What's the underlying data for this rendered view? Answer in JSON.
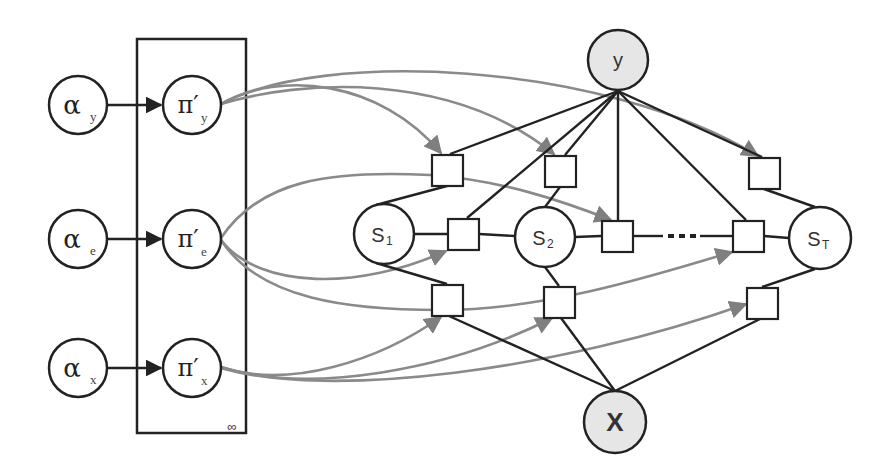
{
  "diagram": {
    "type": "graphical-model",
    "plate": {
      "label": "∞",
      "x": 137,
      "y": 39,
      "width": 109,
      "height": 394
    },
    "colors": {
      "edge": "#222222",
      "param_edge": "#8a8a8a",
      "observed_fill": "#e6e6e6",
      "latent_fill": "#ffffff"
    },
    "hyperparameters": [
      {
        "id": "alpha_y",
        "symbol": "α",
        "subscript": "y",
        "cx": 78,
        "cy": 105
      },
      {
        "id": "alpha_e",
        "symbol": "α",
        "subscript": "e",
        "cx": 78,
        "cy": 239
      },
      {
        "id": "alpha_x",
        "symbol": "α",
        "subscript": "x",
        "cx": 78,
        "cy": 368
      }
    ],
    "parameters": [
      {
        "id": "pi_y",
        "symbol": "π′",
        "subscript": "y",
        "cx": 192,
        "cy": 105
      },
      {
        "id": "pi_e",
        "symbol": "π′",
        "subscript": "e",
        "cx": 192,
        "cy": 239
      },
      {
        "id": "pi_x",
        "symbol": "π′",
        "subscript": "x",
        "cx": 192,
        "cy": 368
      }
    ],
    "observed": [
      {
        "id": "y",
        "label": "y",
        "cx": 618,
        "cy": 60
      },
      {
        "id": "x",
        "label": "X",
        "cx": 615,
        "cy": 422
      }
    ],
    "states": [
      {
        "id": "s1",
        "label": "S",
        "subscript": "1",
        "cx": 384,
        "cy": 234
      },
      {
        "id": "s2",
        "label": "S",
        "subscript": "2",
        "cx": 545,
        "cy": 237
      },
      {
        "id": "sT",
        "label": "S",
        "subscript": "T",
        "cx": 820,
        "cy": 238
      }
    ],
    "factors": [
      {
        "id": "f_top_1",
        "cx": 447,
        "cy": 170
      },
      {
        "id": "f_top_2",
        "cx": 560,
        "cy": 171
      },
      {
        "id": "f_top_T",
        "cx": 764,
        "cy": 173
      },
      {
        "id": "f_mid_1",
        "cx": 463,
        "cy": 234
      },
      {
        "id": "f_mid_2",
        "cx": 617,
        "cy": 236
      },
      {
        "id": "f_mid_T",
        "cx": 748,
        "cy": 236
      },
      {
        "id": "f_bot_1",
        "cx": 447,
        "cy": 300
      },
      {
        "id": "f_bot_2",
        "cx": 559,
        "cy": 302
      },
      {
        "id": "f_bot_T",
        "cx": 762,
        "cy": 303
      }
    ],
    "chain_ellipsis": "· · ·"
  }
}
